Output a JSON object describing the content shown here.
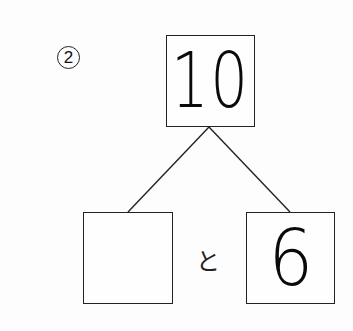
{
  "problem": {
    "number_label": "2",
    "number_display": "②"
  },
  "number_bond": {
    "whole": {
      "value": "10",
      "style": "handwritten"
    },
    "parts": [
      {
        "value": "",
        "status": "blank"
      },
      {
        "value": "6",
        "style": "handwritten"
      }
    ],
    "connector_word": "と"
  },
  "colors": {
    "ink": "#111111",
    "box_border": "#222222",
    "paper": "#fdfdfd"
  }
}
